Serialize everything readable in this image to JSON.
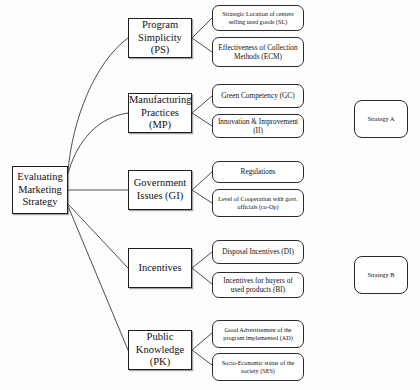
{
  "diagram": {
    "root": {
      "label": "Evaluating Marketing Strategy"
    },
    "criteria": [
      {
        "label": "Program Simplicity (PS)",
        "subcriteria": [
          {
            "label": "Strategic Location of centers selling used goods (SL)",
            "size": "small"
          },
          {
            "label": "Effectiveness of Collection Methods (ECM)",
            "size": "big"
          }
        ]
      },
      {
        "label": "Manufacturing Practices (MP)",
        "subcriteria": [
          {
            "label": "Green Competency (GC)",
            "size": "big"
          },
          {
            "label": "Innovation & Improvement (II)",
            "size": "big"
          }
        ]
      },
      {
        "label": "Government Issues (GI)",
        "subcriteria": [
          {
            "label": "Regulations",
            "size": "big"
          },
          {
            "label": "Level of Cooperation with govt. officials (co-Op)",
            "size": "small"
          }
        ]
      },
      {
        "label": "Incentives",
        "subcriteria": [
          {
            "label": "Disposal Incentives (DI)",
            "size": "big"
          },
          {
            "label": "Incentives for buyers of used products (BI)",
            "size": "big"
          }
        ]
      },
      {
        "label": "Public Knowledge (PK)",
        "subcriteria": [
          {
            "label": "Good Advertisement of the program implemented (AD)",
            "size": "small"
          },
          {
            "label": "Socio-Economic status of the society (SES)",
            "size": "small"
          }
        ]
      }
    ],
    "alternatives": [
      {
        "label": "Strategy A"
      },
      {
        "label": "Strategy B"
      }
    ],
    "colors": {
      "line": "#3a3a3a",
      "box_border": "#1d1d1d",
      "background": "#fdfdfd",
      "text": "#111111"
    }
  }
}
